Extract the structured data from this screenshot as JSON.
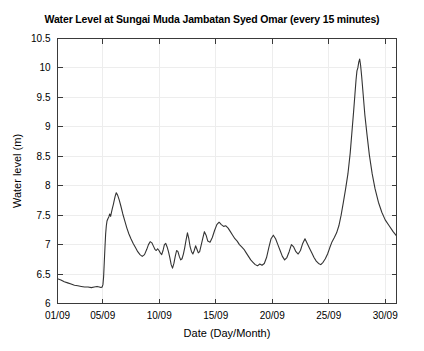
{
  "chart_data": {
    "type": "line",
    "title": "Water Level at Sungai Muda Jambatan Syed Omar (every 15 minutes)",
    "xlabel": "Date (Day/Month)",
    "ylabel": "Water level (m)",
    "xlim": [
      1,
      31
    ],
    "ylim": [
      6,
      10.5
    ],
    "yticks": [
      6,
      6.5,
      7,
      7.5,
      8,
      8.5,
      9,
      9.5,
      10,
      10.5
    ],
    "ytick_labels": [
      "6",
      "6.5",
      "7",
      "7.5",
      "8",
      "8.5",
      "9",
      "9.5",
      "10",
      "10.5"
    ],
    "xticks": [
      1,
      5,
      10,
      15,
      20,
      25,
      30
    ],
    "xtick_labels": [
      "01/09",
      "05/09",
      "10/09",
      "15/09",
      "20/09",
      "25/09",
      "30/09"
    ],
    "grid": true,
    "grid_color": "#ededed",
    "line_color": "#333333",
    "legend": null,
    "series": [
      {
        "name": "Water level",
        "x": [
          1.0,
          1.3,
          1.6,
          1.9,
          2.2,
          2.5,
          2.8,
          3.1,
          3.4,
          3.7,
          4.0,
          4.25,
          4.5,
          4.7,
          4.85,
          4.95,
          5.02,
          5.08,
          5.14,
          5.2,
          5.26,
          5.32,
          5.38,
          5.46,
          5.54,
          5.62,
          5.7,
          5.78,
          5.86,
          5.94,
          6.02,
          6.1,
          6.2,
          6.32,
          6.46,
          6.6,
          6.78,
          6.96,
          7.14,
          7.32,
          7.5,
          7.7,
          7.9,
          8.1,
          8.3,
          8.5,
          8.7,
          8.9,
          9.05,
          9.2,
          9.35,
          9.5,
          9.62,
          9.74,
          9.86,
          9.98,
          10.1,
          10.22,
          10.34,
          10.46,
          10.58,
          10.7,
          10.82,
          10.94,
          11.06,
          11.18,
          11.3,
          11.42,
          11.54,
          11.66,
          11.78,
          11.9,
          12.02,
          12.14,
          12.26,
          12.38,
          12.5,
          12.62,
          12.74,
          12.86,
          12.98,
          13.1,
          13.22,
          13.34,
          13.46,
          13.58,
          13.7,
          13.85,
          14.0,
          14.15,
          14.3,
          14.5,
          14.7,
          14.9,
          15.1,
          15.3,
          15.5,
          15.7,
          15.9,
          16.1,
          16.3,
          16.5,
          16.7,
          16.9,
          17.1,
          17.3,
          17.5,
          17.7,
          17.9,
          18.1,
          18.3,
          18.5,
          18.7,
          18.9,
          19.1,
          19.3,
          19.5,
          19.7,
          19.9,
          20.1,
          20.3,
          20.5,
          20.7,
          20.9,
          21.1,
          21.3,
          21.5,
          21.7,
          21.9,
          22.1,
          22.3,
          22.5,
          22.7,
          22.9,
          23.1,
          23.3,
          23.5,
          23.7,
          23.9,
          24.1,
          24.3,
          24.5,
          24.7,
          24.9,
          25.1,
          25.3,
          25.5,
          25.7,
          25.9,
          26.1,
          26.3,
          26.5,
          26.7,
          26.9,
          27.05,
          27.2,
          27.32,
          27.42,
          27.5,
          27.58,
          27.66,
          27.74,
          27.82,
          27.92,
          28.05,
          28.2,
          28.4,
          28.6,
          28.85,
          29.1,
          29.4,
          29.7,
          30.0,
          30.35,
          30.7,
          31.0
        ],
        "y": [
          6.42,
          6.4,
          6.37,
          6.35,
          6.33,
          6.31,
          6.3,
          6.29,
          6.28,
          6.28,
          6.27,
          6.28,
          6.29,
          6.28,
          6.27,
          6.28,
          6.32,
          6.45,
          6.7,
          6.95,
          7.18,
          7.32,
          7.4,
          7.44,
          7.47,
          7.52,
          7.48,
          7.55,
          7.62,
          7.68,
          7.75,
          7.82,
          7.88,
          7.84,
          7.76,
          7.66,
          7.52,
          7.4,
          7.28,
          7.18,
          7.1,
          7.02,
          6.95,
          6.88,
          6.83,
          6.8,
          6.83,
          6.92,
          7.0,
          7.05,
          7.03,
          6.97,
          6.92,
          6.9,
          6.93,
          6.9,
          6.86,
          6.83,
          6.9,
          7.0,
          7.02,
          6.96,
          6.88,
          6.78,
          6.66,
          6.6,
          6.68,
          6.8,
          6.9,
          6.88,
          6.8,
          6.74,
          6.76,
          6.84,
          6.95,
          7.08,
          7.2,
          7.1,
          6.96,
          6.88,
          6.84,
          6.9,
          6.98,
          6.92,
          6.86,
          6.88,
          6.98,
          7.1,
          7.22,
          7.16,
          7.06,
          7.04,
          7.12,
          7.24,
          7.34,
          7.38,
          7.34,
          7.31,
          7.32,
          7.28,
          7.22,
          7.16,
          7.1,
          7.06,
          7.0,
          6.96,
          6.92,
          6.86,
          6.8,
          6.74,
          6.7,
          6.66,
          6.64,
          6.67,
          6.65,
          6.68,
          6.78,
          6.95,
          7.1,
          7.16,
          7.1,
          7.0,
          6.9,
          6.8,
          6.74,
          6.78,
          6.88,
          7.0,
          6.96,
          6.88,
          6.84,
          6.9,
          7.02,
          7.1,
          7.02,
          6.94,
          6.86,
          6.78,
          6.72,
          6.68,
          6.66,
          6.7,
          6.76,
          6.84,
          6.95,
          7.05,
          7.12,
          7.2,
          7.32,
          7.5,
          7.72,
          7.95,
          8.2,
          8.55,
          8.9,
          9.25,
          9.55,
          9.8,
          9.95,
          10.0,
          10.1,
          10.15,
          10.05,
          9.85,
          9.55,
          9.2,
          8.85,
          8.52,
          8.2,
          7.95,
          7.72,
          7.55,
          7.42,
          7.32,
          7.22,
          7.15
        ]
      }
    ]
  },
  "axes": {
    "y_axis_title": "Water level (m)",
    "x_axis_title": "Date (Day/Month)"
  }
}
